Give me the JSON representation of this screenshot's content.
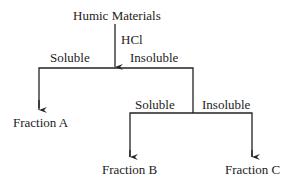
{
  "diagram": {
    "root": "Humic Materials",
    "reagent": "HCl",
    "split1": {
      "left": "Soluble",
      "right": "Insoluble"
    },
    "split2": {
      "left": "Soluble",
      "right": "Insoluble"
    },
    "fractions": {
      "a": "Fraction A",
      "b": "Fraction B",
      "c": "Fraction C"
    },
    "line_color": "#222222"
  }
}
